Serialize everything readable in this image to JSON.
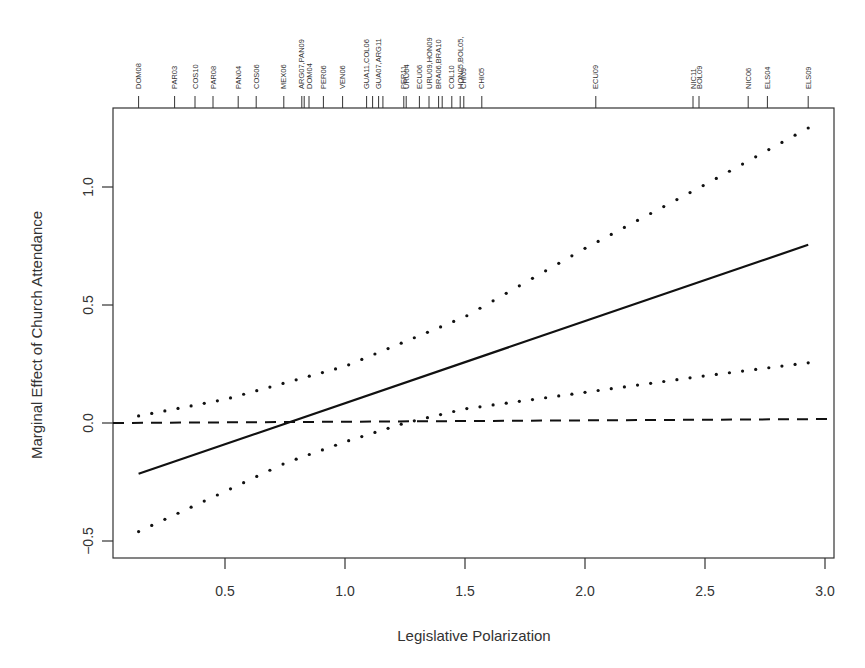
{
  "chart_data": {
    "type": "line",
    "title": "",
    "xlabel": "Legislative Polarization",
    "ylabel": "Marginal Effect of Church Attendance",
    "xlim": [
      0.05,
      3.05
    ],
    "ylim": [
      -0.57,
      1.34
    ],
    "grid": false,
    "legend": null,
    "x_ticks": [
      0.5,
      1.0,
      1.5,
      2.0,
      2.5,
      3.0
    ],
    "x_tick_labels": [
      "0.5",
      "1.0",
      "1.5",
      "2.0",
      "2.5",
      "3.0"
    ],
    "y_ticks": [
      -0.5,
      0.0,
      0.5,
      1.0
    ],
    "y_tick_labels": [
      "-0.5",
      "0.0",
      "0.5",
      "1.0"
    ],
    "series": [
      {
        "name": "Marginal effect",
        "style": "solid",
        "x": [
          0.14,
          2.93
        ],
        "values": [
          -0.215,
          0.755
        ]
      },
      {
        "name": "Upper 95% CI",
        "style": "dotted",
        "x": [
          0.14,
          0.5,
          1.0,
          1.5,
          2.0,
          2.5,
          2.93
        ],
        "values": [
          0.03,
          0.1,
          0.24,
          0.45,
          0.74,
          1.01,
          1.25
        ]
      },
      {
        "name": "Lower 95% CI",
        "style": "dotted",
        "x": [
          0.14,
          0.5,
          0.75,
          1.0,
          1.25,
          1.5,
          2.0,
          2.5,
          2.93
        ],
        "values": [
          -0.46,
          -0.29,
          -0.17,
          -0.08,
          0.0,
          0.06,
          0.13,
          0.2,
          0.255
        ]
      },
      {
        "name": "Zero reference",
        "style": "dashed",
        "x": [
          0.05,
          3.05
        ],
        "values": [
          0.0,
          0.015
        ]
      }
    ],
    "rug": {
      "position": "top",
      "items": [
        {
          "x": 0.14,
          "label": "DOM08"
        },
        {
          "x": 0.29,
          "label": "PAR03"
        },
        {
          "x": 0.375,
          "label": "COS10"
        },
        {
          "x": 0.45,
          "label": "PAR08"
        },
        {
          "x": 0.555,
          "label": "PAN04"
        },
        {
          "x": 0.63,
          "label": "COS06"
        },
        {
          "x": 0.745,
          "label": "MEX06"
        },
        {
          "x": 0.82,
          "label": "ARG07,PAN09"
        },
        {
          "x": 0.83,
          "label": ""
        },
        {
          "x": 0.85,
          "label": "DOM04"
        },
        {
          "x": 0.91,
          "label": "PER06"
        },
        {
          "x": 0.99,
          "label": "VEN06"
        },
        {
          "x": 1.09,
          "label": "GUA11,COL06"
        },
        {
          "x": 1.115,
          "label": ""
        },
        {
          "x": 1.14,
          "label": "GUA07,ARG11"
        },
        {
          "x": 1.158,
          "label": ""
        },
        {
          "x": 1.245,
          "label": "PER11"
        },
        {
          "x": 1.255,
          "label": "URU04"
        },
        {
          "x": 1.31,
          "label": "ECU06"
        },
        {
          "x": 1.35,
          "label": "URU09,HON09"
        },
        {
          "x": 1.39,
          "label": "BRA06,BRA10"
        },
        {
          "x": 1.405,
          "label": ""
        },
        {
          "x": 1.445,
          "label": "COL10"
        },
        {
          "x": 1.48,
          "label": "HON05,BOL05,"
        },
        {
          "x": 1.495,
          "label": "CHI09"
        },
        {
          "x": 1.57,
          "label": "CHI05"
        },
        {
          "x": 2.045,
          "label": "ECU09"
        },
        {
          "x": 2.45,
          "label": "NIC11"
        },
        {
          "x": 2.475,
          "label": "BOL09"
        },
        {
          "x": 2.68,
          "label": "NIC06"
        },
        {
          "x": 2.76,
          "label": "ELS04"
        },
        {
          "x": 2.93,
          "label": "ELS09"
        }
      ]
    }
  },
  "axes": {
    "x_title": "Legislative Polarization",
    "y_title": "Marginal Effect of Church Attendance"
  }
}
